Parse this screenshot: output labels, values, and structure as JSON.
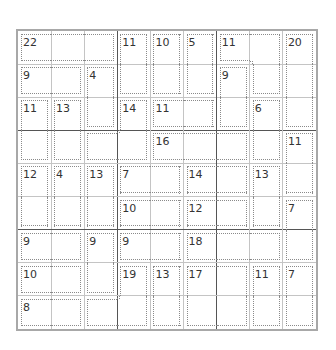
{
  "puzzle": {
    "type": "killer-sudoku",
    "size": 9,
    "colors": {
      "border": "#a8a8a8",
      "box_line": "#555555",
      "cell_line": "#c4c4c4",
      "cage_line": "#8a8a8a",
      "text": "#333333"
    },
    "cages": [
      {
        "sum": "22",
        "cells": [
          [
            0,
            0
          ],
          [
            0,
            1
          ],
          [
            0,
            2
          ]
        ]
      },
      {
        "sum": "11",
        "cells": [
          [
            0,
            3
          ],
          [
            1,
            3
          ]
        ]
      },
      {
        "sum": "10",
        "cells": [
          [
            0,
            4
          ],
          [
            1,
            4
          ]
        ]
      },
      {
        "sum": "5",
        "cells": [
          [
            0,
            5
          ],
          [
            1,
            5
          ]
        ]
      },
      {
        "sum": "11",
        "cells": [
          [
            0,
            6
          ],
          [
            0,
            7
          ],
          [
            1,
            7
          ]
        ]
      },
      {
        "sum": "20",
        "cells": [
          [
            0,
            8
          ],
          [
            1,
            8
          ],
          [
            2,
            8
          ]
        ]
      },
      {
        "sum": "9",
        "cells": [
          [
            1,
            0
          ],
          [
            1,
            1
          ]
        ]
      },
      {
        "sum": "4",
        "cells": [
          [
            1,
            2
          ],
          [
            2,
            2
          ]
        ]
      },
      {
        "sum": "9",
        "cells": [
          [
            1,
            6
          ],
          [
            2,
            6
          ]
        ]
      },
      {
        "sum": "11",
        "cells": [
          [
            2,
            0
          ],
          [
            3,
            0
          ]
        ]
      },
      {
        "sum": "13",
        "cells": [
          [
            2,
            1
          ],
          [
            3,
            1
          ]
        ]
      },
      {
        "sum": "14",
        "cells": [
          [
            2,
            3
          ],
          [
            3,
            3
          ],
          [
            3,
            2
          ]
        ]
      },
      {
        "sum": "11",
        "cells": [
          [
            2,
            4
          ],
          [
            2,
            5
          ]
        ]
      },
      {
        "sum": "6",
        "cells": [
          [
            2,
            7
          ],
          [
            3,
            7
          ]
        ]
      },
      {
        "sum": "16",
        "cells": [
          [
            3,
            4
          ],
          [
            3,
            5
          ],
          [
            3,
            6
          ]
        ]
      },
      {
        "sum": "11",
        "cells": [
          [
            3,
            8
          ],
          [
            4,
            8
          ]
        ]
      },
      {
        "sum": "12",
        "cells": [
          [
            4,
            0
          ],
          [
            5,
            0
          ]
        ]
      },
      {
        "sum": "4",
        "cells": [
          [
            4,
            1
          ],
          [
            5,
            1
          ]
        ]
      },
      {
        "sum": "13",
        "cells": [
          [
            4,
            2
          ],
          [
            5,
            2
          ]
        ]
      },
      {
        "sum": "7",
        "cells": [
          [
            4,
            3
          ],
          [
            4,
            4
          ]
        ]
      },
      {
        "sum": "14",
        "cells": [
          [
            4,
            5
          ],
          [
            4,
            6
          ]
        ]
      },
      {
        "sum": "13",
        "cells": [
          [
            4,
            7
          ],
          [
            5,
            7
          ]
        ]
      },
      {
        "sum": "10",
        "cells": [
          [
            5,
            3
          ],
          [
            5,
            4
          ]
        ]
      },
      {
        "sum": "12",
        "cells": [
          [
            5,
            5
          ],
          [
            5,
            6
          ]
        ]
      },
      {
        "sum": "7",
        "cells": [
          [
            5,
            8
          ],
          [
            6,
            8
          ]
        ]
      },
      {
        "sum": "9",
        "cells": [
          [
            6,
            0
          ],
          [
            6,
            1
          ]
        ]
      },
      {
        "sum": "9",
        "cells": [
          [
            6,
            2
          ],
          [
            7,
            2
          ]
        ]
      },
      {
        "sum": "9",
        "cells": [
          [
            6,
            3
          ],
          [
            6,
            4
          ]
        ]
      },
      {
        "sum": "18",
        "cells": [
          [
            6,
            5
          ],
          [
            6,
            6
          ],
          [
            6,
            7
          ]
        ]
      },
      {
        "sum": "10",
        "cells": [
          [
            7,
            0
          ],
          [
            7,
            1
          ]
        ]
      },
      {
        "sum": "19",
        "cells": [
          [
            7,
            3
          ],
          [
            8,
            3
          ],
          [
            8,
            2
          ]
        ]
      },
      {
        "sum": "13",
        "cells": [
          [
            7,
            4
          ],
          [
            8,
            4
          ]
        ]
      },
      {
        "sum": "17",
        "cells": [
          [
            7,
            5
          ],
          [
            7,
            6
          ],
          [
            8,
            5
          ],
          [
            8,
            6
          ]
        ]
      },
      {
        "sum": "11",
        "cells": [
          [
            7,
            7
          ],
          [
            8,
            7
          ]
        ]
      },
      {
        "sum": "7",
        "cells": [
          [
            7,
            8
          ],
          [
            8,
            8
          ]
        ]
      },
      {
        "sum": "8",
        "cells": [
          [
            8,
            0
          ],
          [
            8,
            1
          ]
        ]
      }
    ]
  }
}
